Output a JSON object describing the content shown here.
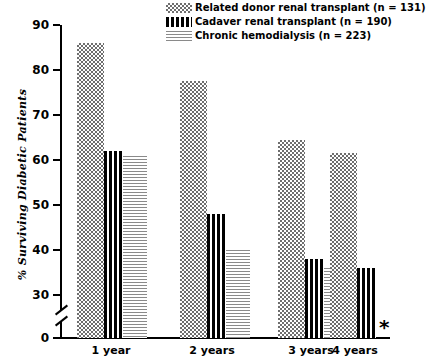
{
  "chart_data": {
    "type": "bar",
    "title": "",
    "xlabel": "",
    "ylabel": "% Surviving Diabetic Patients",
    "categories": [
      "1 year",
      "2 years",
      "3 years",
      "4 years"
    ],
    "ylim": [
      0,
      90
    ],
    "yticks": [
      0,
      30,
      40,
      50,
      60,
      70,
      80,
      90
    ],
    "ytick_labels": [
      "0",
      "30",
      "40",
      "50",
      "60",
      "70",
      "80",
      "90"
    ],
    "axis_break": true,
    "axis_break_between": [
      0,
      30
    ],
    "grid": false,
    "legend_position": "top-right",
    "series": [
      {
        "name": "Related donor renal transplant (n = 131)",
        "pattern": "dots",
        "values": [
          86,
          77.5,
          64.5,
          61.5
        ]
      },
      {
        "name": "Cadaver renal transplant (n = 190)",
        "pattern": "vertical-stripes",
        "values": [
          62,
          48,
          38,
          36
        ]
      },
      {
        "name": "Chronic hemodialysis (n = 223)",
        "pattern": "horizontal-lines",
        "values": [
          61,
          40,
          36,
          null
        ]
      }
    ],
    "annotations": [
      {
        "text": "*",
        "near": "4 years / chronic hemodialysis",
        "meaning": "no bar shown"
      }
    ]
  },
  "legend": {
    "items": [
      {
        "label": "Related donor renal transplant (n = 131)",
        "swatch": "dots-swatch"
      },
      {
        "label": "Cadaver renal transplant (n = 190)",
        "swatch": "vertical-stripes-swatch"
      },
      {
        "label": "Chronic hemodialysis (n = 223)",
        "swatch": "horizontal-lines-swatch"
      }
    ]
  },
  "axis": {
    "y_title": "% Surviving Diabetic Patients",
    "y_tick_labels": [
      "90",
      "80",
      "70",
      "60",
      "50",
      "40",
      "30",
      "0"
    ],
    "x_tick_labels": [
      "1 year",
      "2 years",
      "3 years",
      "4 years"
    ]
  },
  "footnote": {
    "star": "*"
  }
}
